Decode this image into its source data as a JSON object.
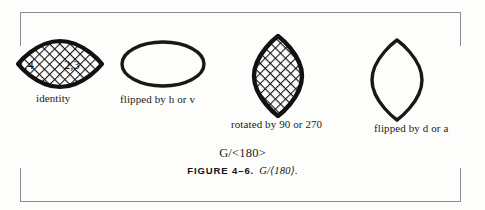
{
  "figure": {
    "formula": "G/<180>",
    "number": "FIGURE 4–6.",
    "expression": "G/⟨180⟩."
  },
  "shapes": [
    {
      "id": "identity",
      "caption": "identity",
      "form": "wide-lens",
      "fill": "crosshatch",
      "vertex_labels": {
        "left": "1,4",
        "right": "2,3"
      }
    },
    {
      "id": "flipped-h-v",
      "caption": "flipped by h or v",
      "form": "wide-ellipse",
      "fill": "none"
    },
    {
      "id": "rotated-90-270",
      "caption": "rotated by 90 or 270",
      "form": "tall-lens",
      "fill": "crosshatch"
    },
    {
      "id": "flipped-d-a",
      "caption": "flipped by d or a",
      "form": "tall-lens",
      "fill": "none"
    }
  ],
  "colors": {
    "ink": "#141110",
    "page": "#fdfdfc",
    "cropmark": "#8d8d8d"
  }
}
